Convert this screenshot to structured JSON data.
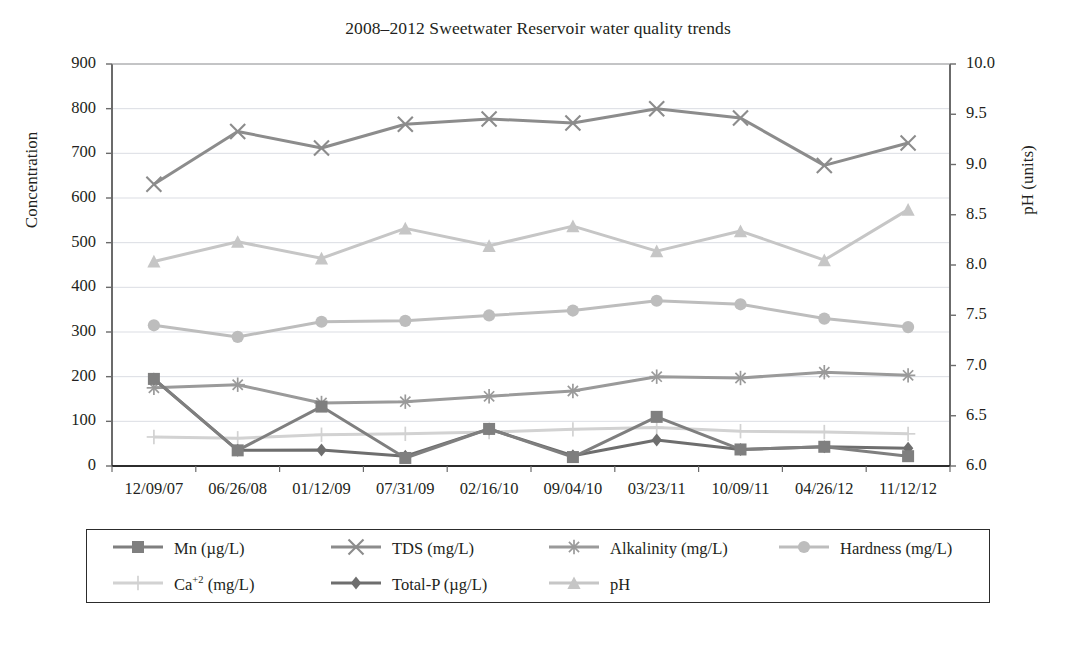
{
  "chart_data": {
    "type": "line",
    "title": "2008–2012 Sweetwater Reservoir water quality trends",
    "xlabel": "",
    "ylabel": "Concentration",
    "y2label": "pH (units)",
    "grid": true,
    "legend_position": "bottom",
    "categories": [
      "12/09/07",
      "06/26/08",
      "01/12/09",
      "07/31/09",
      "02/16/10",
      "09/04/10",
      "03/23/11",
      "10/09/11",
      "04/26/12",
      "11/12/12"
    ],
    "ylim": [
      0,
      900
    ],
    "yticks": [
      "0",
      "100",
      "200",
      "300",
      "400",
      "500",
      "600",
      "700",
      "800",
      "900"
    ],
    "y2lim": [
      6.0,
      10.0
    ],
    "y2ticks": [
      "6.0",
      "6.5",
      "7.0",
      "7.5",
      "8.0",
      "8.5",
      "9.0",
      "9.5",
      "10.0"
    ],
    "series": [
      {
        "name": "Mn (µg/L)",
        "marker": "square",
        "color": "#7f7f7f",
        "axis": "left",
        "values": [
          195,
          35,
          133,
          18,
          83,
          20,
          110,
          37,
          43,
          22
        ]
      },
      {
        "name": "TDS (mg/L)",
        "marker": "x",
        "color": "#8c8c8c",
        "axis": "left",
        "values": [
          631,
          749,
          712,
          765,
          777,
          768,
          800,
          779,
          673,
          723
        ]
      },
      {
        "name": "Alkalinity (mg/L)",
        "marker": "asterisk",
        "color": "#9a9a9a",
        "axis": "left",
        "values": [
          175,
          182,
          141,
          144,
          156,
          168,
          200,
          197,
          210,
          203
        ]
      },
      {
        "name": "Hardness (mg/L)",
        "marker": "circle",
        "color": "#bdbdbd",
        "axis": "left",
        "values": [
          315,
          289,
          323,
          325,
          337,
          348,
          370,
          362,
          330,
          311
        ]
      },
      {
        "name": "Ca",
        "name_sup": "+2",
        "name_tail": " (mg/L)",
        "marker": "plus",
        "color": "#d2d2d2",
        "axis": "left",
        "values": [
          65,
          62,
          70,
          72,
          76,
          82,
          86,
          78,
          76,
          72
        ]
      },
      {
        "name": "Total-P (µg/L)",
        "marker": "diamond",
        "color": "#6e6e6e",
        "axis": "left",
        "values": [
          195,
          35,
          36,
          22,
          83,
          23,
          58,
          37,
          43,
          40
        ]
      },
      {
        "name": "pH",
        "marker": "triangle",
        "color": "#c6c6c6",
        "axis": "right",
        "values": [
          458,
          502,
          465,
          532,
          493,
          537,
          481,
          526,
          461,
          574
        ],
        "ph_values": [
          8.04,
          8.23,
          8.07,
          8.37,
          8.19,
          8.39,
          8.14,
          8.34,
          8.05,
          8.55
        ]
      }
    ]
  },
  "legend": {
    "row1": [
      "Mn (µg/L)",
      "TDS (mg/L)",
      "Alkalinity (mg/L)",
      "Hardness (mg/L)"
    ],
    "row2": [
      "Ca+2 (mg/L)",
      "Total-P (µg/L)",
      "pH"
    ]
  }
}
